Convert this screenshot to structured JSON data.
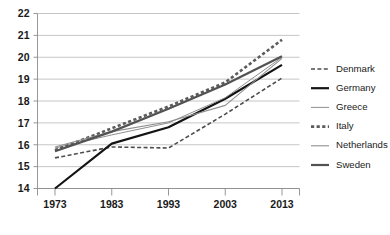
{
  "chart_data": {
    "type": "line",
    "title": "",
    "subtitle": "",
    "xlabel": "",
    "ylabel": "",
    "x": [
      1973,
      1983,
      1993,
      2003,
      2013
    ],
    "xticks": [
      "1973",
      "1983",
      "1993",
      "2003",
      "2013"
    ],
    "yticks": [
      "14",
      "15",
      "16",
      "17",
      "18",
      "19",
      "20",
      "21",
      "22"
    ],
    "xlim": [
      1968,
      2018
    ],
    "ylim": [
      14,
      22
    ],
    "grid": "horizontal",
    "legend_position": "right",
    "series": [
      {
        "name": "Denmark",
        "style": "dashed",
        "color": "#4d4d4d",
        "width": 1.6,
        "dash": "4,2.4",
        "values": [
          15.4,
          15.9,
          15.85,
          17.4,
          19.05
        ]
      },
      {
        "name": "Germany",
        "style": "solid",
        "color": "#141414",
        "width": 2.2,
        "dash": "",
        "values": [
          14.0,
          16.05,
          16.8,
          18.1,
          19.65
        ]
      },
      {
        "name": "Greece",
        "style": "solid",
        "color": "#8f8f8f",
        "width": 1.0,
        "dash": "",
        "values": [
          15.85,
          16.45,
          17.0,
          18.15,
          20.0
        ]
      },
      {
        "name": "Italy",
        "style": "dotted",
        "color": "#5c5c5c",
        "width": 2.6,
        "dash": "3.2,2.4",
        "values": [
          15.75,
          16.75,
          17.75,
          18.85,
          20.8
        ]
      },
      {
        "name": "Netherlands",
        "style": "solid",
        "color": "#8f8f8f",
        "width": 1.1,
        "dash": "",
        "values": [
          15.9,
          16.6,
          17.05,
          17.8,
          19.95
        ]
      },
      {
        "name": "Sweden",
        "style": "solid",
        "color": "#525252",
        "width": 2.2,
        "dash": "",
        "values": [
          15.7,
          16.6,
          17.65,
          18.75,
          20.05
        ]
      }
    ]
  },
  "legend": {
    "items": [
      {
        "label": "Denmark"
      },
      {
        "label": "Germany"
      },
      {
        "label": "Greece"
      },
      {
        "label": "Italy"
      },
      {
        "label": "Netherlands"
      },
      {
        "label": "Sweden"
      }
    ]
  }
}
